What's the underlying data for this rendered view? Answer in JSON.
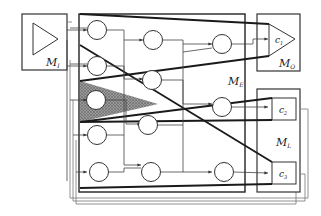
{
  "diagram": {
    "modules": {
      "input": {
        "label": "M",
        "sub": "I"
      },
      "hidden": {
        "label": "M",
        "sub": "E"
      },
      "output": {
        "label": "M",
        "sub": "O"
      },
      "loop": {
        "label": "M",
        "sub": "L"
      }
    },
    "cells": {
      "c1": {
        "label": "c",
        "sub": "1"
      },
      "c2": {
        "label": "c",
        "sub": "2"
      },
      "c3": {
        "label": "c",
        "sub": "3"
      }
    },
    "colors": {
      "stroke": "#333333",
      "thick": "#1a1a1a",
      "shade": "#555555",
      "background": "#ffffff"
    }
  }
}
